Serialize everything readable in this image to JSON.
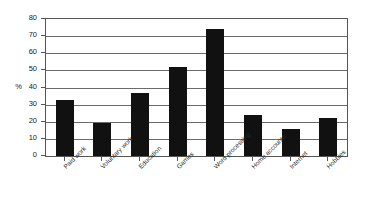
{
  "chart_data": {
    "type": "bar",
    "title": "",
    "subtitle": "",
    "xlabel": "",
    "ylabel": "%",
    "ylim": [
      0,
      80
    ],
    "ytick_step": 10,
    "yticks": [
      0,
      10,
      20,
      30,
      40,
      50,
      60,
      70,
      80
    ],
    "grid": true,
    "legend": false,
    "legend_position": "none",
    "bar_color": "#111111",
    "categories": [
      "Paid work",
      "Voluntary work",
      "Education",
      "Games",
      "Word processing",
      "Home accounts",
      "Internet",
      "Hobbies"
    ],
    "values": [
      33,
      19,
      37,
      52,
      74,
      24,
      16,
      22
    ]
  }
}
